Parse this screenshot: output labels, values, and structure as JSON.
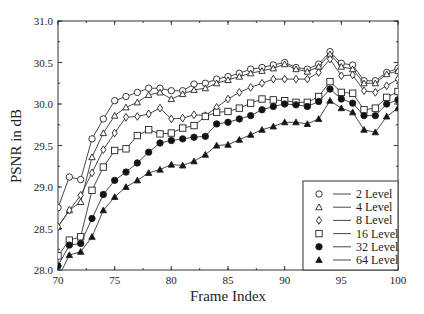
{
  "chart_data": {
    "type": "line",
    "title": "",
    "xlabel": "Frame Index",
    "ylabel": "PSNR in dB",
    "xlim": [
      70,
      100
    ],
    "ylim": [
      28.0,
      31.0
    ],
    "xticks": [
      "70",
      "75",
      "80",
      "85",
      "90",
      "95",
      "100"
    ],
    "yticks": [
      "28.0",
      "28.5",
      "29.0",
      "29.5",
      "30.0",
      "30.5",
      "31.0"
    ],
    "grid": false,
    "legend_position": "lower right",
    "x": [
      70,
      71,
      72,
      73,
      74,
      75,
      76,
      77,
      78,
      79,
      80,
      81,
      82,
      83,
      84,
      85,
      86,
      87,
      88,
      89,
      90,
      91,
      92,
      93,
      94,
      95,
      96,
      97,
      98,
      99,
      100
    ],
    "series": [
      {
        "name": "2 Level",
        "marker": "circle-open",
        "values": [
          28.75,
          29.12,
          29.09,
          29.58,
          29.82,
          30.04,
          30.09,
          30.14,
          30.19,
          30.19,
          30.16,
          30.16,
          30.24,
          30.25,
          30.3,
          30.33,
          30.37,
          30.42,
          30.44,
          30.47,
          30.5,
          30.44,
          30.42,
          30.48,
          30.63,
          30.49,
          30.47,
          30.28,
          30.28,
          30.38,
          30.43
        ]
      },
      {
        "name": "4 Level",
        "marker": "triangle-open",
        "values": [
          28.52,
          28.72,
          28.82,
          29.36,
          29.65,
          29.86,
          29.96,
          30.02,
          30.11,
          30.14,
          30.06,
          30.12,
          30.17,
          30.19,
          30.25,
          30.29,
          30.33,
          30.37,
          30.4,
          30.43,
          30.48,
          30.42,
          30.39,
          30.45,
          30.6,
          30.45,
          30.42,
          30.25,
          30.25,
          30.36,
          30.4
        ]
      },
      {
        "name": "8 Level",
        "marker": "diamond-open",
        "values": [
          28.52,
          28.72,
          28.9,
          29.17,
          29.45,
          29.65,
          29.84,
          29.85,
          29.88,
          29.95,
          29.82,
          29.83,
          29.87,
          29.86,
          29.96,
          30.06,
          30.14,
          30.2,
          30.25,
          30.3,
          30.3,
          30.3,
          30.3,
          30.38,
          30.54,
          30.34,
          30.35,
          30.16,
          30.14,
          30.22,
          30.3
        ]
      },
      {
        "name": "16 Level",
        "marker": "square-open",
        "values": [
          28.17,
          28.36,
          28.4,
          28.96,
          29.24,
          29.44,
          29.46,
          29.62,
          29.69,
          29.64,
          29.65,
          29.71,
          29.74,
          29.85,
          29.9,
          29.91,
          29.95,
          30.01,
          30.06,
          30.05,
          30.04,
          30.02,
          30.02,
          30.09,
          30.27,
          30.14,
          30.13,
          29.93,
          29.95,
          30.08,
          30.15
        ]
      },
      {
        "name": "32 Level",
        "marker": "circle-filled",
        "values": [
          28.05,
          28.3,
          28.32,
          28.62,
          28.91,
          29.08,
          29.18,
          29.29,
          29.42,
          29.53,
          29.56,
          29.58,
          29.6,
          29.61,
          29.76,
          29.78,
          29.82,
          29.86,
          29.93,
          29.97,
          30.0,
          29.99,
          29.97,
          30.03,
          30.18,
          30.06,
          30.01,
          29.86,
          29.86,
          30.0,
          30.05
        ]
      },
      {
        "name": "64 Level",
        "marker": "triangle-filled",
        "values": [
          27.9,
          28.18,
          28.22,
          28.4,
          28.72,
          28.88,
          29.0,
          29.08,
          29.17,
          29.21,
          29.27,
          29.26,
          29.31,
          29.39,
          29.5,
          29.51,
          29.57,
          29.63,
          29.69,
          29.73,
          29.78,
          29.78,
          29.76,
          29.82,
          30.04,
          29.95,
          29.9,
          29.69,
          29.66,
          29.85,
          29.95
        ]
      }
    ]
  }
}
